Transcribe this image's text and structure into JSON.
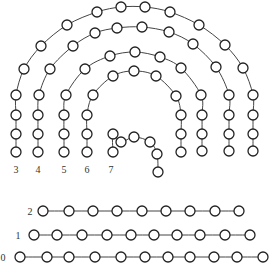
{
  "diagram": {
    "line_color": "#444444",
    "node_fill": "#ffffff",
    "node_radius": 5,
    "chains": [
      {
        "label": "3",
        "label_pos": [
          16,
          169
        ],
        "nodes": [
          [
            16,
            152
          ],
          [
            16,
            134
          ],
          [
            16,
            115
          ],
          [
            16,
            95
          ],
          [
            24,
            69
          ],
          [
            41,
            46
          ],
          [
            67,
            25
          ],
          [
            97,
            12
          ],
          [
            121,
            7
          ],
          [
            145,
            7
          ],
          [
            170,
            12
          ],
          [
            199,
            25
          ],
          [
            225,
            45
          ],
          [
            243,
            68
          ],
          [
            253,
            95
          ],
          [
            253,
            115
          ],
          [
            253,
            134
          ],
          [
            253,
            151
          ]
        ]
      },
      {
        "label": "4",
        "label_pos": [
          38,
          169
        ],
        "nodes": [
          [
            38,
            152
          ],
          [
            38,
            134
          ],
          [
            38,
            115
          ],
          [
            39,
            95
          ],
          [
            50,
            69
          ],
          [
            73,
            46
          ],
          [
            95,
            33
          ],
          [
            117,
            28
          ],
          [
            142,
            27
          ],
          [
            169,
            32
          ],
          [
            193,
            44
          ],
          [
            216,
            67
          ],
          [
            229,
            95
          ],
          [
            229,
            115
          ],
          [
            229,
            134
          ],
          [
            229,
            151
          ]
        ]
      },
      {
        "label": "5",
        "label_pos": [
          64,
          169
        ],
        "nodes": [
          [
            64,
            152
          ],
          [
            64,
            134
          ],
          [
            64,
            115
          ],
          [
            66,
            95
          ],
          [
            85,
            69
          ],
          [
            110,
            56
          ],
          [
            135,
            52
          ],
          [
            160,
            57
          ],
          [
            181,
            68
          ],
          [
            201,
            95
          ],
          [
            202,
            115
          ],
          [
            202,
            134
          ],
          [
            202,
            151
          ]
        ]
      },
      {
        "label": "6",
        "label_pos": [
          87,
          169
        ],
        "nodes": [
          [
            87,
            152
          ],
          [
            87,
            134
          ],
          [
            87,
            115
          ],
          [
            93,
            95
          ],
          [
            113,
            76
          ],
          [
            134,
            71
          ],
          [
            156,
            76
          ],
          [
            176,
            96
          ],
          [
            181,
            115
          ],
          [
            181,
            134
          ],
          [
            181,
            152
          ]
        ]
      },
      {
        "label": "7",
        "label_pos": [
          111,
          169
        ],
        "nodes": [
          [
            113,
            152
          ],
          [
            113,
            134
          ],
          [
            121,
            142
          ],
          [
            134,
            137
          ],
          [
            150,
            142
          ],
          [
            157,
            154
          ],
          [
            158,
            172
          ]
        ]
      },
      {
        "label": "2",
        "label_pos": [
          30,
          211
        ],
        "nodes": [
          [
            43,
            211
          ],
          [
            69,
            211
          ],
          [
            93,
            211
          ],
          [
            117,
            211
          ],
          [
            142,
            211
          ],
          [
            166,
            211
          ],
          [
            190,
            211
          ],
          [
            215,
            211
          ],
          [
            239,
            211
          ]
        ]
      },
      {
        "label": "1",
        "label_pos": [
          18,
          235
        ],
        "nodes": [
          [
            34,
            235
          ],
          [
            57,
            235
          ],
          [
            82,
            235
          ],
          [
            107,
            235
          ],
          [
            131,
            235
          ],
          [
            154,
            235
          ],
          [
            177,
            235
          ],
          [
            200,
            235
          ],
          [
            225,
            235
          ],
          [
            250,
            235
          ]
        ]
      },
      {
        "label": "0",
        "label_pos": [
          3,
          257
        ],
        "nodes": [
          [
            20,
            257
          ],
          [
            47,
            257
          ],
          [
            69,
            257
          ],
          [
            95,
            257
          ],
          [
            121,
            257
          ],
          [
            145,
            257
          ],
          [
            168,
            257
          ],
          [
            190,
            257
          ],
          [
            214,
            257
          ],
          [
            237,
            257
          ],
          [
            263,
            257
          ]
        ]
      }
    ]
  }
}
